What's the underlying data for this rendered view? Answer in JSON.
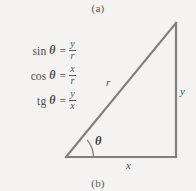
{
  "figure": {
    "caption_top": "(a)",
    "caption_bottom": "(b)",
    "background_color": "#f4f3f1",
    "line_color": "#808080"
  },
  "formulas": [
    {
      "name": "sin",
      "theta": "θ",
      "equals": "=",
      "numerator": "y",
      "denominator": "r"
    },
    {
      "name": "cos",
      "theta": "θ",
      "equals": "=",
      "numerator": "x",
      "denominator": "r"
    },
    {
      "name": "tg",
      "theta": "θ",
      "equals": "=",
      "numerator": "y",
      "denominator": "x"
    }
  ],
  "triangle": {
    "hypotenuse_label": "r",
    "vertical_side_label": "y",
    "horizontal_side_label": "x",
    "angle_label": "θ",
    "vertices": {
      "bottom_left": [
        66,
        157
      ],
      "bottom_right": [
        176,
        157
      ],
      "top_right": [
        176,
        23
      ]
    }
  }
}
